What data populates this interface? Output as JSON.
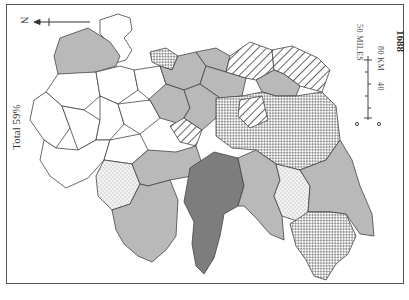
{
  "map": {
    "year": "1688",
    "total_label": "Total 59%",
    "north_label": "N",
    "scale": {
      "miles_label": "50 MILES",
      "km_label": "80 KM",
      "km_mid": "40",
      "zero_miles": "0",
      "zero_km": "0"
    },
    "fills": {
      "white": "#ffffff",
      "light_gray": "#b9b9b9",
      "dark_gray": "#7d7d7d",
      "outline": "#444444",
      "frame": "#555555"
    },
    "region_categories": [
      "blank",
      "light-gray",
      "dark-gray",
      "diagonal-hatch",
      "crosshatch",
      "stipple"
    ]
  }
}
